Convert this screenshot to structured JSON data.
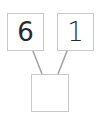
{
  "diagram": {
    "type": "number-bond",
    "parts": [
      {
        "label": "6"
      },
      {
        "label": "1"
      }
    ],
    "whole": {
      "label": ""
    },
    "line_color": "#a0a0a0",
    "box_border_color": "#c8c8c8"
  }
}
